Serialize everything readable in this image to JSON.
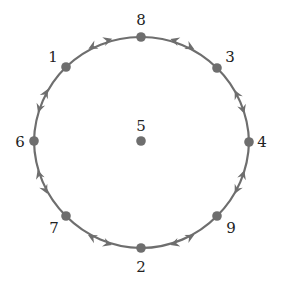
{
  "diagram": {
    "type": "cycle-graph",
    "circle": {
      "cx": 141,
      "cy": 142,
      "r": 107
    },
    "colors": {
      "edge": "#6e6e6e",
      "node": "#6e6e6e",
      "label": "#222222",
      "background": "#ffffff"
    },
    "nodes": [
      {
        "id": "8",
        "label": "8",
        "x": 141,
        "y": 37,
        "lx": 141,
        "ly": 25,
        "anchor": "middle"
      },
      {
        "id": "3",
        "label": "3",
        "x": 217,
        "y": 68,
        "lx": 230,
        "ly": 62,
        "anchor": "middle"
      },
      {
        "id": "4",
        "label": "4",
        "x": 249,
        "y": 142,
        "lx": 262,
        "ly": 147,
        "anchor": "middle"
      },
      {
        "id": "9",
        "label": "9",
        "x": 217,
        "y": 216,
        "lx": 231,
        "ly": 233,
        "anchor": "middle"
      },
      {
        "id": "2",
        "label": "2",
        "x": 141,
        "y": 248,
        "lx": 141,
        "ly": 272,
        "anchor": "middle"
      },
      {
        "id": "7",
        "label": "7",
        "x": 66,
        "y": 216,
        "lx": 54,
        "ly": 233,
        "anchor": "middle"
      },
      {
        "id": "6",
        "label": "6",
        "x": 34,
        "y": 141,
        "lx": 20,
        "ly": 147,
        "anchor": "middle"
      },
      {
        "id": "1",
        "label": "1",
        "x": 66,
        "y": 67,
        "lx": 53,
        "ly": 62,
        "anchor": "middle"
      },
      {
        "id": "5",
        "label": "5",
        "x": 141,
        "y": 141,
        "lx": 141,
        "ly": 131,
        "anchor": "middle",
        "isolated": true
      }
    ],
    "edges": [
      {
        "from": "8",
        "to": "3",
        "bidirectional": true
      },
      {
        "from": "3",
        "to": "4",
        "bidirectional": true
      },
      {
        "from": "4",
        "to": "9",
        "bidirectional": true
      },
      {
        "from": "9",
        "to": "2",
        "bidirectional": true
      },
      {
        "from": "2",
        "to": "7",
        "bidirectional": true
      },
      {
        "from": "7",
        "to": "6",
        "bidirectional": true
      },
      {
        "from": "6",
        "to": "1",
        "bidirectional": true
      },
      {
        "from": "1",
        "to": "8",
        "bidirectional": true
      }
    ]
  }
}
